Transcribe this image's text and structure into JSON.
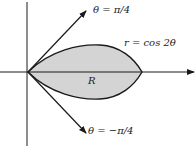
{
  "diagram": {
    "labels": {
      "upper_ray": "θ = π/4",
      "lower_ray": "θ = −π/4",
      "curve": "r = cos 2θ",
      "region": "R"
    },
    "colors": {
      "region_fill": "#d4d4d4",
      "stroke": "#1a1a1a",
      "background": "#ffffff"
    }
  }
}
